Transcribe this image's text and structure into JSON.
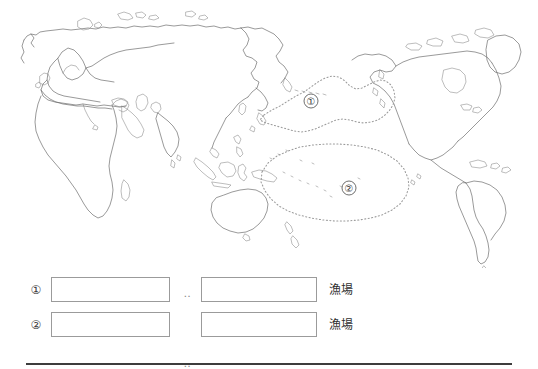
{
  "page": {
    "background_color": "#ffffff",
    "ink_color": "#2b2b2b"
  },
  "map": {
    "name": "world-map-pacific-centered",
    "description": "Outline world map centred on the Pacific Ocean, coastlines only, no fill",
    "coast_stroke_color": "#6e6e6e",
    "zone_stroke_color": "#9a9a9a",
    "zones": [
      {
        "id": "zone-1",
        "marker_label": "①",
        "marker_x": 311,
        "marker_y": 101,
        "region_name_hint": "North Pacific"
      },
      {
        "id": "zone-2",
        "marker_label": "②",
        "marker_x": 349,
        "marker_y": 188,
        "region_name_hint": "Central / South Pacific"
      }
    ]
  },
  "answers": {
    "ellipsis": "‥",
    "rows": [
      {
        "number": "①",
        "box_a_value": "",
        "box_a_placeholder": "",
        "separator": "‥",
        "box_b_value": "",
        "box_b_placeholder": "",
        "suffix": "漁場"
      },
      {
        "number": "②",
        "box_a_value": "",
        "box_a_placeholder": "",
        "separator": "‥",
        "box_b_value": "",
        "box_b_placeholder": "",
        "suffix": "漁場"
      }
    ]
  },
  "divider": {
    "name": "bottom-rule",
    "color": "#3d3d3d"
  }
}
